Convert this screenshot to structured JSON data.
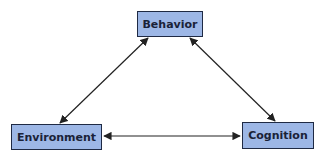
{
  "diagram": {
    "type": "triangle-relationship",
    "nodes": [
      {
        "id": "behavior",
        "label": "Behavior"
      },
      {
        "id": "environment",
        "label": "Environment"
      },
      {
        "id": "cognition",
        "label": "Cognition"
      }
    ],
    "edges": [
      {
        "from": "behavior",
        "to": "environment",
        "bidirectional": true
      },
      {
        "from": "behavior",
        "to": "cognition",
        "bidirectional": true
      },
      {
        "from": "environment",
        "to": "cognition",
        "bidirectional": true
      }
    ],
    "colors": {
      "node_fill": "#9db7e6",
      "node_border": "#1f2a44",
      "text": "#1a2238",
      "edge": "#222222"
    }
  }
}
